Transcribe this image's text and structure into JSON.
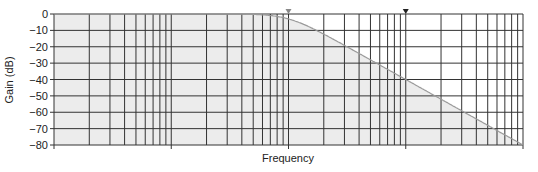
{
  "chart_data": {
    "type": "line",
    "title": "",
    "xlabel": "Frequency",
    "ylabel": "Gain (dB)",
    "xscale": "log",
    "x_decades": 4,
    "x_tick_labels": [],
    "ylim": [
      -80,
      0
    ],
    "y_ticks": [
      0,
      -10,
      -20,
      -30,
      -40,
      -50,
      -60,
      -70,
      -80
    ],
    "y_tick_labels": [
      "0",
      "−10",
      "−20",
      "−30",
      "−40",
      "−50",
      "−60",
      "−70",
      "−80"
    ],
    "grid": true,
    "legend": null,
    "series": [
      {
        "name": "Low-pass magnitude response",
        "description": "Flat at 0 dB until cutoff (~2 decades in), then rolls off at about −40 dB/decade",
        "x_decade_position": [
          0,
          0.5,
          1,
          1.5,
          2,
          2.25,
          2.5,
          2.75,
          3,
          3.25,
          3.5,
          3.75,
          4
        ],
        "values_db": [
          0,
          0,
          0,
          0,
          -1,
          -3,
          -8,
          -22,
          -40,
          -50,
          -60,
          -70,
          -80
        ]
      }
    ],
    "annotations": [
      {
        "type": "marker",
        "shape": "triangle-down",
        "x_decade_position": 2.0,
        "color": "#888888",
        "meaning": "cutoff frequency"
      },
      {
        "type": "marker",
        "shape": "triangle-down",
        "x_decade_position": 3.0,
        "color": "#222222"
      }
    ],
    "fill_under_curve": true
  },
  "colors": {
    "plot_fill": "#ececec",
    "grid": "#333333",
    "curve": "#9a9a9a",
    "text": "#222222"
  }
}
